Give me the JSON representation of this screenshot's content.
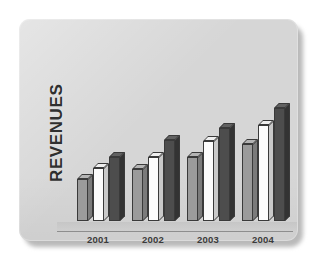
{
  "chart_data": {
    "type": "bar",
    "title": "",
    "xlabel": "",
    "ylabel": "REVENUES",
    "categories": [
      "2001",
      "2002",
      "2003",
      "2004"
    ],
    "grid": false,
    "legend": "none",
    "style": "3d-clustered-column",
    "ylim": [
      0,
      130
    ],
    "series": [
      {
        "name": "series-1",
        "color": "#9b9b9b",
        "values": [
          44,
          54,
          67,
          80
        ]
      },
      {
        "name": "series-2",
        "color": "#fcfcfc",
        "values": [
          55,
          67,
          83,
          100
        ]
      },
      {
        "name": "series-3",
        "color": "#4d4d4d",
        "values": [
          67,
          84,
          97,
          117
        ]
      }
    ],
    "annotations": []
  },
  "figure": {
    "panel_color": "#d6d6d6",
    "baseline_color": "#8e8e8e",
    "axis_title": "REVENUES"
  }
}
